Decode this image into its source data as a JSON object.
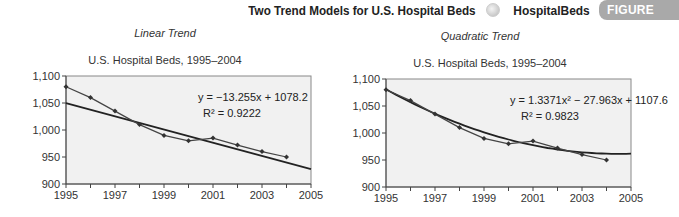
{
  "header": {
    "title": "Two Trend Models for U.S. Hospital Beds",
    "file_name": "HospitalBeds",
    "badge": "FIGURE 15.13",
    "icon": "globe-icon"
  },
  "chart_data": [
    {
      "type": "line",
      "subtitle": "Linear Trend",
      "title": "U.S. Hospital Beds, 1995–2004",
      "xlabel": "",
      "ylabel": "",
      "x": [
        1995,
        1996,
        1997,
        1998,
        1999,
        2000,
        2001,
        2002,
        2003,
        2004
      ],
      "series": [
        {
          "name": "Hospital Beds",
          "values": [
            1080,
            1060,
            1035,
            1010,
            990,
            980,
            985,
            972,
            960,
            950
          ]
        },
        {
          "name": "Linear trend",
          "equation": "y = −13.255x + 1078.2",
          "r2": "R² = 0.9222"
        }
      ],
      "xlim": [
        1995,
        2005
      ],
      "ylim": [
        900,
        1100
      ],
      "xticks": [
        "1995",
        "1997",
        "1999",
        "2001",
        "2003",
        "2005"
      ],
      "yticks": [
        "900",
        "950",
        "1,000",
        "1,050",
        "1,100"
      ],
      "grid": false
    },
    {
      "type": "line",
      "subtitle": "Quadratic Trend",
      "title": "U.S. Hospital Beds, 1995–2004",
      "xlabel": "",
      "ylabel": "",
      "x": [
        1995,
        1996,
        1997,
        1998,
        1999,
        2000,
        2001,
        2002,
        2003,
        2004
      ],
      "series": [
        {
          "name": "Hospital Beds",
          "values": [
            1080,
            1060,
            1035,
            1010,
            990,
            980,
            985,
            972,
            960,
            950
          ]
        },
        {
          "name": "Quadratic trend",
          "equation": "y = 1.3371x² − 27.963x + 1107.6",
          "r2": "R² = 0.9823"
        }
      ],
      "xlim": [
        1995,
        2005
      ],
      "ylim": [
        900,
        1100
      ],
      "xticks": [
        "1995",
        "1997",
        "1999",
        "2001",
        "2003",
        "2005"
      ],
      "yticks": [
        "900",
        "950",
        "1,000",
        "1,050",
        "1,100"
      ],
      "grid": false
    }
  ]
}
